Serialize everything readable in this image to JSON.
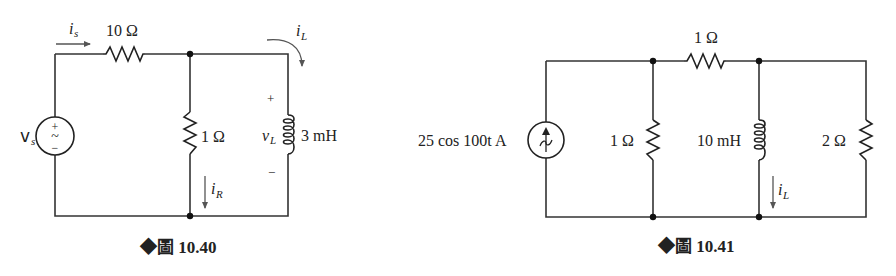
{
  "figures": [
    {
      "id": "fig-10-40",
      "caption": "◆圖 10.40",
      "source": {
        "type": "ac-voltage-source",
        "label_main": "v",
        "label_sub": "s",
        "plus": "+",
        "minus": "−",
        "symbol": "~"
      },
      "components": {
        "series_resistor": {
          "label": "10 Ω"
        },
        "shunt_resistor": {
          "label": "1 Ω"
        },
        "inductor": {
          "label": "3 mH"
        }
      },
      "currents": {
        "is": {
          "main": "i",
          "sub": "s"
        },
        "iL": {
          "main": "i",
          "sub": "L"
        },
        "iR": {
          "main": "i",
          "sub": "R"
        }
      },
      "voltage": {
        "main": "v",
        "sub": "L",
        "plus": "+",
        "minus": "−"
      }
    },
    {
      "id": "fig-10-41",
      "caption": "◆圖 10.41",
      "source": {
        "type": "ac-current-source",
        "label": "25 cos 100t A"
      },
      "components": {
        "shunt_resistor_left": {
          "label": "1 Ω"
        },
        "series_resistor": {
          "label": "1 Ω"
        },
        "inductor": {
          "label": "10 mH"
        },
        "shunt_resistor_right": {
          "label": "2 Ω"
        }
      },
      "currents": {
        "iL": {
          "main": "i",
          "sub": "L"
        }
      }
    }
  ]
}
